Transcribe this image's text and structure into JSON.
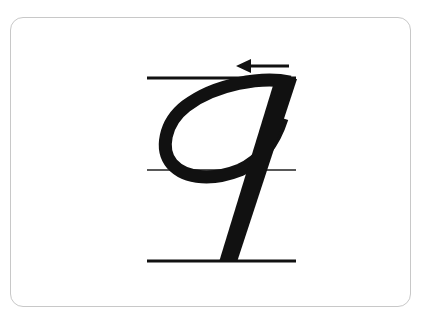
{
  "card": {
    "letter": "q",
    "stroke_direction": "left",
    "colors": {
      "ink": "#111111",
      "border": "#c8c8c8",
      "background": "#ffffff"
    },
    "guide_lines": [
      "top",
      "middle",
      "baseline"
    ]
  }
}
